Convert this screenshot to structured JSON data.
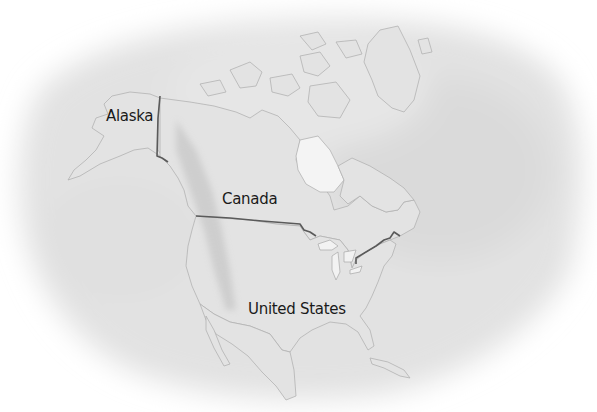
{
  "map": {
    "title": "North America",
    "style": "grayscale watercolor",
    "colors": {
      "background": "#ffffff",
      "wash": "#d6d6d6",
      "land": "#e4e4e4",
      "coastline": "#b0b0b0",
      "border": "#5a5a5a",
      "text": "#1a1a1a"
    },
    "labels": [
      {
        "id": "alaska",
        "text": "Alaska",
        "x": 110,
        "y": 124
      },
      {
        "id": "canada",
        "text": "Canada",
        "x": 222,
        "y": 186
      },
      {
        "id": "united-states",
        "text": "United States",
        "x": 248,
        "y": 300
      }
    ],
    "borders": [
      {
        "id": "alaska-canada",
        "name": "Alaska–Canada border"
      },
      {
        "id": "us-canada",
        "name": "US–Canada border"
      }
    ]
  }
}
